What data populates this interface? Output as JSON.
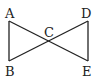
{
  "diagram": {
    "title": "",
    "points": [
      {
        "id": "A",
        "label": "A"
      },
      {
        "id": "B",
        "label": "B"
      },
      {
        "id": "C",
        "label": "C"
      },
      {
        "id": "D",
        "label": "D"
      },
      {
        "id": "E",
        "label": "E"
      }
    ],
    "segments": [
      [
        "A",
        "B"
      ],
      [
        "A",
        "E"
      ],
      [
        "B",
        "D"
      ],
      [
        "D",
        "E"
      ]
    ],
    "triangles": [
      [
        "A",
        "B",
        "C"
      ],
      [
        "C",
        "D",
        "E"
      ]
    ],
    "stroke_color": "#222222"
  }
}
